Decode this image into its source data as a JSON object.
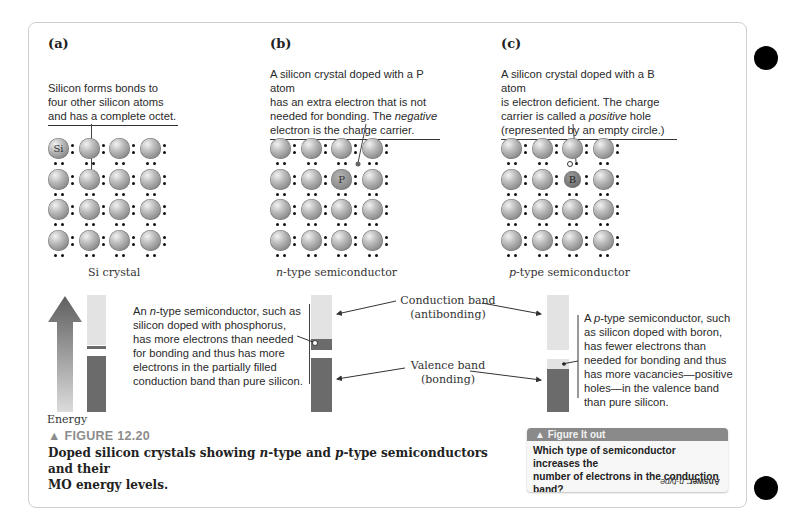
{
  "panels": {
    "a": {
      "label": "(a)",
      "callout": [
        "Silicon forms bonds to",
        "four other silicon atoms",
        "and has a complete octet."
      ],
      "grid_caption": "Si crystal",
      "special_atom_label": "Si"
    },
    "b": {
      "label": "(b)",
      "callout_lines": [
        "A silicon crystal doped with a P atom",
        "has an extra electron that is not",
        "needed for bonding. The ",
        "negative",
        "electron is the charge carrier."
      ],
      "grid_caption_italic": "n",
      "grid_caption_rest": "-type semiconductor",
      "dopant_label": "P"
    },
    "c": {
      "label": "(c)",
      "callout_lines": [
        "A silicon crystal doped with a B atom",
        "is electron deficient. The charge",
        "carrier is called a ",
        "positive",
        " hole",
        "(represented by an empty circle.)"
      ],
      "grid_caption_italic": "p",
      "grid_caption_rest": "-type semiconductor",
      "dopant_label": "B"
    }
  },
  "energy_diagram": {
    "energy_label": "Energy",
    "n_note": {
      "pre": "An ",
      "italic": "n",
      "lines": [
        "-type semiconductor, such as",
        "silicon doped with phosphorus,",
        "has more electrons than needed",
        "for bonding and thus has more",
        "electrons in the partially filled",
        "conduction band than pure silicon."
      ]
    },
    "conduction_band": {
      "title": "Conduction band",
      "sub": "(antibonding)"
    },
    "valence_band": {
      "title": "Valence band",
      "sub": "(bonding)"
    },
    "p_note": {
      "pre": "A ",
      "italic": "p",
      "lines": [
        "-type semiconductor, such",
        "as silicon doped with boron,",
        "has fewer electrons than",
        "needed for bonding and thus",
        "has more vacancies—positive",
        "holes—in the valence band",
        "than pure silicon."
      ]
    },
    "colors": {
      "empty_band": "#e3e3e3",
      "filled_band": "#6b6b6b",
      "arrow_top": "#5e5e5e",
      "arrow_bottom": "#d8d8d8"
    }
  },
  "figure": {
    "number": "▲ FIGURE 12.20",
    "caption_parts": [
      "Doped silicon crystals showing ",
      "n",
      "-type and ",
      "p",
      "-type semiconductors and their"
    ],
    "caption_line2": "MO energy levels."
  },
  "figure_it_out": {
    "header": "▲ Figure It out",
    "question_line1": "Which type of semiconductor increases the",
    "question_line2": "number of electrons in the conduction band?",
    "answer_label": "Answer:",
    "answer_value": "n-type."
  }
}
